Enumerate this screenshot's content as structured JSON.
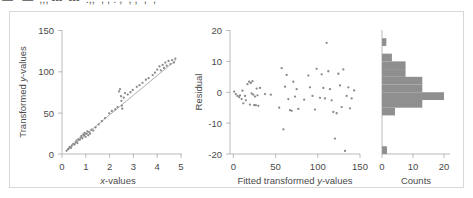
{
  "figure": {
    "clipped_top_fragments": "—   —  ,,, ---  ---  .,,  , , . ,  , ,  ,  ,",
    "frame_color": "#d8d8d8",
    "point_color": "#8a8a8a",
    "bar_color": "#8f8f8f",
    "axis_color": "#a8a8a8",
    "panel_count": 3
  },
  "chart_data": [
    {
      "type": "scatter",
      "name": "transformed-fit-panel",
      "title": "",
      "xlabel": "x-values",
      "ylabel": "Transformed y-values",
      "xlim": [
        0,
        5.25
      ],
      "ylim": [
        0,
        158
      ],
      "xticks": [
        0,
        1,
        2,
        3,
        4,
        5
      ],
      "xticklabels": [
        "0",
        "1",
        "2",
        "3",
        "4",
        "5"
      ],
      "yticks": [
        0,
        50,
        100,
        150
      ],
      "yticklabels": [
        "0",
        "50",
        "100",
        "150"
      ],
      "grid": false,
      "legend": null,
      "fit_line": {
        "x": [
          0.18,
          5.02
        ],
        "y": [
          4,
          120
        ]
      },
      "points": [
        {
          "x": 0.2,
          "y": 4
        },
        {
          "x": 0.26,
          "y": 6
        },
        {
          "x": 0.3,
          "y": 7
        },
        {
          "x": 0.34,
          "y": 9
        },
        {
          "x": 0.4,
          "y": 8
        },
        {
          "x": 0.44,
          "y": 11
        },
        {
          "x": 0.5,
          "y": 13
        },
        {
          "x": 0.55,
          "y": 12
        },
        {
          "x": 0.6,
          "y": 15
        },
        {
          "x": 0.64,
          "y": 17
        },
        {
          "x": 0.68,
          "y": 14
        },
        {
          "x": 0.72,
          "y": 19
        },
        {
          "x": 0.78,
          "y": 18
        },
        {
          "x": 0.82,
          "y": 21
        },
        {
          "x": 0.86,
          "y": 23
        },
        {
          "x": 0.9,
          "y": 20
        },
        {
          "x": 0.94,
          "y": 25
        },
        {
          "x": 0.98,
          "y": 24
        },
        {
          "x": 1.0,
          "y": 27
        },
        {
          "x": 1.04,
          "y": 22
        },
        {
          "x": 1.08,
          "y": 26
        },
        {
          "x": 1.12,
          "y": 29
        },
        {
          "x": 1.16,
          "y": 24
        },
        {
          "x": 1.2,
          "y": 28
        },
        {
          "x": 1.24,
          "y": 26
        },
        {
          "x": 1.3,
          "y": 31
        },
        {
          "x": 1.38,
          "y": 30
        },
        {
          "x": 1.48,
          "y": 34
        },
        {
          "x": 1.62,
          "y": 38
        },
        {
          "x": 1.76,
          "y": 42
        },
        {
          "x": 1.9,
          "y": 46
        },
        {
          "x": 2.08,
          "y": 52
        },
        {
          "x": 2.2,
          "y": 55
        },
        {
          "x": 2.35,
          "y": 57
        },
        {
          "x": 2.45,
          "y": 60
        },
        {
          "x": 2.52,
          "y": 80
        },
        {
          "x": 2.56,
          "y": 83
        },
        {
          "x": 2.6,
          "y": 74
        },
        {
          "x": 2.62,
          "y": 68
        },
        {
          "x": 2.64,
          "y": 62
        },
        {
          "x": 2.66,
          "y": 58
        },
        {
          "x": 2.72,
          "y": 72
        },
        {
          "x": 2.78,
          "y": 78
        },
        {
          "x": 2.9,
          "y": 76
        },
        {
          "x": 3.02,
          "y": 79
        },
        {
          "x": 3.12,
          "y": 82
        },
        {
          "x": 3.3,
          "y": 86
        },
        {
          "x": 3.42,
          "y": 88
        },
        {
          "x": 3.55,
          "y": 91
        },
        {
          "x": 3.7,
          "y": 95
        },
        {
          "x": 3.82,
          "y": 97
        },
        {
          "x": 4.0,
          "y": 101
        },
        {
          "x": 4.1,
          "y": 104
        },
        {
          "x": 4.2,
          "y": 108
        },
        {
          "x": 4.3,
          "y": 112
        },
        {
          "x": 4.36,
          "y": 107
        },
        {
          "x": 4.44,
          "y": 114
        },
        {
          "x": 4.5,
          "y": 110
        },
        {
          "x": 4.56,
          "y": 117
        },
        {
          "x": 4.62,
          "y": 113
        },
        {
          "x": 4.7,
          "y": 119
        },
        {
          "x": 4.78,
          "y": 115
        },
        {
          "x": 4.86,
          "y": 120
        },
        {
          "x": 4.94,
          "y": 117
        },
        {
          "x": 5.0,
          "y": 122
        }
      ]
    },
    {
      "type": "scatter",
      "name": "residual-panel",
      "title": "",
      "xlabel": "Fitted transformed y-values",
      "ylabel": "Residual",
      "xlim": [
        -4,
        152
      ],
      "ylim": [
        -20,
        20
      ],
      "xticks": [
        0,
        50,
        100,
        150
      ],
      "xticklabels": [
        "0",
        "50",
        "100",
        "150"
      ],
      "yticks": [
        -20,
        -10,
        0,
        10,
        20
      ],
      "yticklabels": [
        "-20",
        "-10",
        "0",
        "10",
        "20"
      ],
      "grid": false,
      "legend": null,
      "points": [
        {
          "x": 1,
          "y": 0.2
        },
        {
          "x": 3,
          "y": -0.6
        },
        {
          "x": 5,
          "y": -1.2
        },
        {
          "x": 7,
          "y": -1.6
        },
        {
          "x": 8,
          "y": -1.0
        },
        {
          "x": 10,
          "y": -2.2
        },
        {
          "x": 11,
          "y": 0.5
        },
        {
          "x": 12,
          "y": -3.6
        },
        {
          "x": 14,
          "y": -1.2
        },
        {
          "x": 15,
          "y": -2.6
        },
        {
          "x": 17,
          "y": 2.6
        },
        {
          "x": 19,
          "y": 3.4
        },
        {
          "x": 20,
          "y": -4.0
        },
        {
          "x": 21,
          "y": 3.0
        },
        {
          "x": 22,
          "y": -0.4
        },
        {
          "x": 23,
          "y": 3.6
        },
        {
          "x": 24,
          "y": -0.8
        },
        {
          "x": 25,
          "y": -4.2
        },
        {
          "x": 26,
          "y": -1.4
        },
        {
          "x": 27,
          "y": -4.2
        },
        {
          "x": 28,
          "y": 1.2
        },
        {
          "x": 29,
          "y": -1.0
        },
        {
          "x": 30,
          "y": -4.4
        },
        {
          "x": 32,
          "y": 1.4
        },
        {
          "x": 38,
          "y": -0.6
        },
        {
          "x": 45,
          "y": -0.8
        },
        {
          "x": 55,
          "y": -5.0
        },
        {
          "x": 58,
          "y": 7.8
        },
        {
          "x": 60,
          "y": -12.0
        },
        {
          "x": 62,
          "y": 1.8
        },
        {
          "x": 64,
          "y": 5.6
        },
        {
          "x": 66,
          "y": -2.2
        },
        {
          "x": 68,
          "y": -5.8
        },
        {
          "x": 70,
          "y": -6.0
        },
        {
          "x": 72,
          "y": 3.4
        },
        {
          "x": 74,
          "y": -1.4
        },
        {
          "x": 76,
          "y": 1.0
        },
        {
          "x": 78,
          "y": -5.4
        },
        {
          "x": 85,
          "y": -2.4
        },
        {
          "x": 90,
          "y": 5.4
        },
        {
          "x": 92,
          "y": 1.6
        },
        {
          "x": 95,
          "y": -1.2
        },
        {
          "x": 98,
          "y": -5.6
        },
        {
          "x": 100,
          "y": 7.6
        },
        {
          "x": 104,
          "y": -1.8
        },
        {
          "x": 106,
          "y": 5.8
        },
        {
          "x": 108,
          "y": 1.4
        },
        {
          "x": 110,
          "y": -2.0
        },
        {
          "x": 112,
          "y": 16.0
        },
        {
          "x": 114,
          "y": 6.8
        },
        {
          "x": 116,
          "y": 1.0
        },
        {
          "x": 118,
          "y": -2.6
        },
        {
          "x": 120,
          "y": -6.4
        },
        {
          "x": 122,
          "y": -15.0
        },
        {
          "x": 124,
          "y": -6.8
        },
        {
          "x": 126,
          "y": 6.0
        },
        {
          "x": 128,
          "y": 2.2
        },
        {
          "x": 130,
          "y": -4.8
        },
        {
          "x": 132,
          "y": 7.4
        },
        {
          "x": 134,
          "y": -19.0
        },
        {
          "x": 136,
          "y": -1.2
        },
        {
          "x": 138,
          "y": 1.6
        },
        {
          "x": 140,
          "y": -5.2
        },
        {
          "x": 142,
          "y": -2.0
        },
        {
          "x": 145,
          "y": 0.6
        }
      ]
    },
    {
      "type": "bar",
      "name": "residual-histogram-panel",
      "orientation": "horizontal",
      "title": "",
      "xlabel": "Counts",
      "ylabel": "",
      "xlim": [
        0,
        22
      ],
      "ylim": [
        -20,
        20
      ],
      "xticks": [
        0,
        10,
        20
      ],
      "xticklabels": [
        "0",
        "10",
        "20"
      ],
      "grid": false,
      "legend": null,
      "bin_edges": [
        -20,
        -17.5,
        -15,
        -12.5,
        -10,
        -7.5,
        -5,
        -2.5,
        0,
        2.5,
        5,
        7.5,
        10,
        12.5,
        15,
        17.5,
        20
      ],
      "categories": [
        "-20 to -17.5",
        "-17.5 to -15",
        "-15 to -12.5",
        "-12.5 to -10",
        "-10 to -7.5",
        "-7.5 to -5",
        "-5 to -2.5",
        "-2.5 to 0",
        "0 to 2.5",
        "2.5 to 5",
        "5 to 7.5",
        "7.5 to 10",
        "10 to 12.5",
        "12.5 to 15",
        "15 to 17.5",
        "17.5 to 20"
      ],
      "values": [
        1.6,
        0,
        0,
        0,
        0,
        4.2,
        13.0,
        20.0,
        13.0,
        13.0,
        7.6,
        7.6,
        3.2,
        0,
        1.4,
        0
      ]
    }
  ]
}
